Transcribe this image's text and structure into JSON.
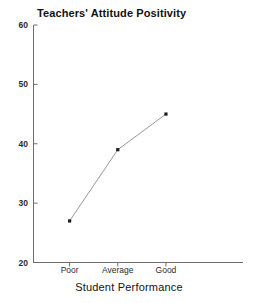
{
  "chart_data": {
    "type": "line",
    "title": "Teachers' Attitude Positivity",
    "xlabel": "Student Performance",
    "ylabel": "",
    "categories": [
      "Poor",
      "Average",
      "Good"
    ],
    "values": [
      27,
      39,
      45
    ],
    "ylim": [
      20,
      60
    ],
    "yticks": [
      20,
      30,
      40,
      50,
      60
    ],
    "ytick_labels": [
      "20",
      "30",
      "40",
      "50",
      "60"
    ],
    "grid": false,
    "legend": null,
    "legend_position": "none",
    "series": [
      {
        "name": "Teachers' Attitude Positivity",
        "values": [
          27,
          39,
          45
        ]
      }
    ],
    "marker": "square",
    "line_color": "#8c8c8c",
    "marker_color": "#1a1a1a"
  },
  "colors": {
    "background": "#ffffff",
    "axis": "#6e6e6e",
    "text": "#1a1a1a",
    "line": "#8c8c8c"
  }
}
